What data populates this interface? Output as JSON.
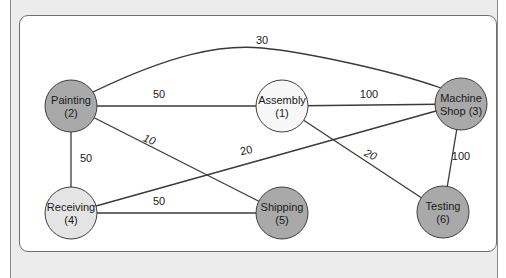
{
  "diagram": {
    "type": "weighted-undirected-graph",
    "colors": {
      "dark_node": "#a9a9a9",
      "light_node": "#e4e4e4",
      "white_node": "#f7f7f7",
      "edge": "#3a3a3a",
      "panel_bg": "#ffffff",
      "outer_bg": "#ececec"
    },
    "nodes": [
      {
        "id": "1",
        "name": "Assembly",
        "number": "(1)",
        "line1": "Assembly",
        "line2": "(1)",
        "shade": "white"
      },
      {
        "id": "2",
        "name": "Painting",
        "number": "(2)",
        "line1": "Painting",
        "line2": "(2)",
        "shade": "dark"
      },
      {
        "id": "3",
        "name": "Machine Shop",
        "number": "(3)",
        "line1": "Machine",
        "line2": "Shop (3)",
        "shade": "dark"
      },
      {
        "id": "4",
        "name": "Receiving",
        "number": "(4)",
        "line1": "Receiving",
        "line2": "(4)",
        "shade": "light"
      },
      {
        "id": "5",
        "name": "Shipping",
        "number": "(5)",
        "line1": "Shipping",
        "line2": "(5)",
        "shade": "dark"
      },
      {
        "id": "6",
        "name": "Testing",
        "number": "(6)",
        "line1": "Testing",
        "line2": "(6)",
        "shade": "dark"
      }
    ],
    "edges": [
      {
        "from": "2",
        "to": "3",
        "weight": "30",
        "curved": true
      },
      {
        "from": "2",
        "to": "1",
        "weight": "50"
      },
      {
        "from": "1",
        "to": "3",
        "weight": "100"
      },
      {
        "from": "2",
        "to": "4",
        "weight": "50"
      },
      {
        "from": "2",
        "to": "5",
        "weight": "10",
        "italic": true
      },
      {
        "from": "4",
        "to": "3",
        "weight": "20"
      },
      {
        "from": "1",
        "to": "6",
        "weight": "20",
        "italic": true
      },
      {
        "from": "3",
        "to": "6",
        "weight": "100"
      },
      {
        "from": "4",
        "to": "5",
        "weight": "50"
      }
    ]
  }
}
